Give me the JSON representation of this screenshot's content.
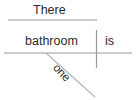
{
  "diagram": {
    "type": "sentence-diagram",
    "style": "Reed-Kellogg",
    "sentence": "There is one bathroom",
    "colors": {
      "text": "#2b2b2b",
      "line": "#9a9a9a",
      "background": "#ffffff"
    },
    "words": {
      "there": "There",
      "bathroom": "bathroom",
      "is": "is",
      "one": "one"
    },
    "lines": {
      "top_line": {
        "x1": 8,
        "y1": 20,
        "x2": 97,
        "y2": 20
      },
      "baseline": {
        "x1": 4,
        "y1": 53,
        "x2": 132,
        "y2": 53
      },
      "divider": {
        "x1": 96.5,
        "y1": 30,
        "x2": 96.5,
        "y2": 68
      },
      "modifier_diagonal": {
        "x1": 46,
        "y1": 53,
        "x2": 95,
        "y2": 97
      }
    }
  }
}
